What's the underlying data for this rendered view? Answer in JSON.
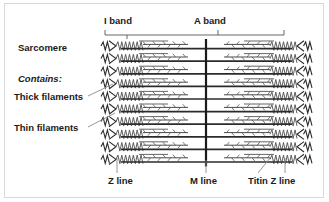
{
  "diagram": {
    "title_labels": {
      "i_band": "I band",
      "a_band": "A band"
    },
    "left_labels": {
      "sarcomere": "Sarcomere",
      "contains": "Contains:",
      "thick_filaments": "Thick filaments",
      "thin_filaments": "Thin filaments"
    },
    "bottom_labels": {
      "z_line": "Z line",
      "m_line": "M line",
      "titin_z_line": "Titin Z line"
    },
    "colors": {
      "background": "#ffffff",
      "frame_border": "#d9d9d9",
      "text": "#1b1b1b",
      "thick_filament": "#2b2b2b",
      "thin_filament": "#4a4a4a",
      "titin_spring": "#555555",
      "m_line": "#1a1a1a",
      "leader_line": "#8a8a8a",
      "scale_bar": "#555555"
    },
    "structure": {
      "row_count": 10,
      "first_row_y": 46,
      "row_spacing": 12.6,
      "z_line_left_x": 113,
      "z_line_right_x": 300,
      "m_line_x": 206,
      "scale_bar_y": 35,
      "scale_bar_left_x": 105,
      "scale_bar_right_x": 284,
      "scale_tick_i_band_x": 127,
      "scale_tick_a_band_x": 218
    }
  }
}
